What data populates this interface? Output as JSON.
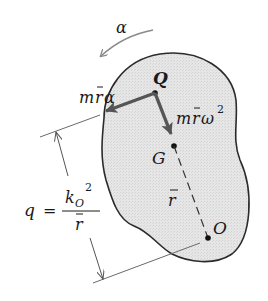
{
  "diagram": {
    "type": "rigid-body-kinetics",
    "labels": {
      "angular_accel": "α",
      "point_q": "Q",
      "point_g": "G",
      "point_o": "O",
      "tangential_force_m": "m",
      "tangential_force_r": "r",
      "tangential_force_alpha": "α",
      "normal_force_m": "m",
      "normal_force_r": "r",
      "normal_force_omega": "ω",
      "normal_force_exp": "2",
      "rbar": "r",
      "q_var": "q",
      "equals": "=",
      "k": "k",
      "k_sub": "O",
      "k_exp": "2",
      "denom_r": "r"
    },
    "colors": {
      "body_fill": "#e4e4e4",
      "outline": "#2b2b2b",
      "force_arrow": "#555555",
      "thin_line": "#6a6a6a",
      "alpha_arrow": "#8a8a8a"
    },
    "points": {
      "Q": [
        155,
        93
      ],
      "G": [
        174,
        146
      ],
      "O": [
        208,
        238
      ]
    }
  }
}
